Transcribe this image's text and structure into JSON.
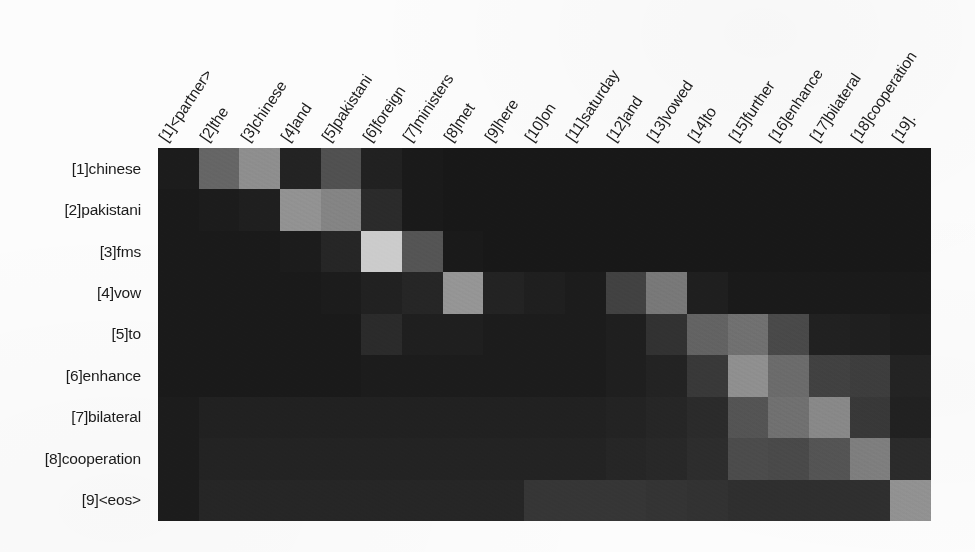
{
  "figure": {
    "kind": "attention-heatmap",
    "colormap": "grayscale",
    "background_color": "#fcfcfc",
    "grid_color": "#101010"
  },
  "chart_data": {
    "type": "heatmap",
    "title": "",
    "xlabel": "",
    "ylabel": "",
    "grid": false,
    "legend": "none",
    "colormap": "gray",
    "vmin": 0,
    "vmax": 1,
    "x_tick_rotation": -56,
    "columns": [
      "[1]<partner>",
      "[2]the",
      "[3]chinese",
      "[4]and",
      "[5]pakistani",
      "[6]foreign",
      "[7]ministers",
      "[8]met",
      "[9]here",
      "[10]on",
      "[11]saturday",
      "[12]and",
      "[13]vowed",
      "[14]to",
      "[15]further",
      "[16]enhance",
      "[17]bilateral",
      "[18]cooperation",
      "[19]."
    ],
    "rows": [
      "[1]chinese",
      "[2]pakistani",
      "[3]fms",
      "[4]vow",
      "[5]to",
      "[6]enhance",
      "[7]bilateral",
      "[8]cooperation",
      "[9]<eos>"
    ],
    "values": [
      [
        0.06,
        0.37,
        0.54,
        0.09,
        0.28,
        0.08,
        0.05,
        0.04,
        0.04,
        0.04,
        0.04,
        0.04,
        0.04,
        0.04,
        0.04,
        0.04,
        0.04,
        0.04,
        0.04
      ],
      [
        0.05,
        0.06,
        0.07,
        0.56,
        0.5,
        0.12,
        0.05,
        0.04,
        0.04,
        0.04,
        0.04,
        0.04,
        0.04,
        0.04,
        0.04,
        0.04,
        0.04,
        0.04,
        0.04
      ],
      [
        0.05,
        0.05,
        0.05,
        0.06,
        0.1,
        0.8,
        0.3,
        0.05,
        0.04,
        0.04,
        0.04,
        0.04,
        0.04,
        0.04,
        0.04,
        0.04,
        0.04,
        0.04,
        0.04
      ],
      [
        0.05,
        0.05,
        0.05,
        0.05,
        0.06,
        0.08,
        0.1,
        0.57,
        0.09,
        0.07,
        0.06,
        0.22,
        0.45,
        0.07,
        0.05,
        0.05,
        0.05,
        0.05,
        0.05
      ],
      [
        0.05,
        0.05,
        0.05,
        0.05,
        0.05,
        0.12,
        0.07,
        0.07,
        0.06,
        0.06,
        0.06,
        0.07,
        0.15,
        0.36,
        0.42,
        0.25,
        0.08,
        0.07,
        0.06
      ],
      [
        0.05,
        0.05,
        0.05,
        0.05,
        0.05,
        0.06,
        0.06,
        0.06,
        0.06,
        0.06,
        0.06,
        0.07,
        0.09,
        0.18,
        0.55,
        0.4,
        0.22,
        0.2,
        0.09
      ],
      [
        0.06,
        0.08,
        0.08,
        0.08,
        0.08,
        0.08,
        0.08,
        0.08,
        0.08,
        0.08,
        0.08,
        0.09,
        0.1,
        0.12,
        0.3,
        0.42,
        0.52,
        0.18,
        0.08
      ],
      [
        0.06,
        0.09,
        0.09,
        0.09,
        0.09,
        0.09,
        0.09,
        0.09,
        0.09,
        0.09,
        0.09,
        0.1,
        0.11,
        0.13,
        0.26,
        0.25,
        0.3,
        0.48,
        0.12
      ],
      [
        0.06,
        0.1,
        0.1,
        0.1,
        0.1,
        0.1,
        0.1,
        0.1,
        0.1,
        0.17,
        0.17,
        0.17,
        0.16,
        0.15,
        0.14,
        0.14,
        0.14,
        0.14,
        0.56
      ]
    ]
  }
}
